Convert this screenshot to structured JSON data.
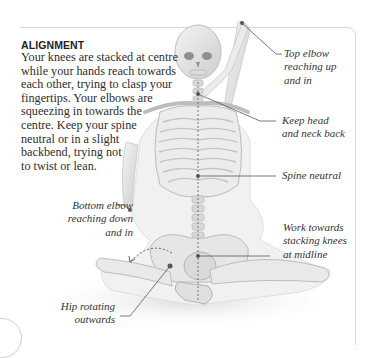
{
  "section": {
    "heading": "ALIGNMENT",
    "body_lines": [
      "Your knees are stacked at centre",
      "while your hands reach towards",
      "each other, trying to clasp your",
      "fingertips. Your elbows are",
      "squeezing in towards the",
      "centre. Keep your spine",
      "neutral or in a slight",
      "backbend, trying not",
      "to twist or lean."
    ]
  },
  "annotations": {
    "top_elbow": [
      "Top elbow",
      "reaching up",
      "and in"
    ],
    "head_neck": [
      "Keep head",
      "and neck back"
    ],
    "spine": [
      "Spine neutral"
    ],
    "knees": [
      "Work towards",
      "stacking knees",
      "at midline"
    ],
    "bottom_elbow": [
      "Bottom elbow",
      "reaching down",
      "and in"
    ],
    "hip": [
      "Hip rotating",
      "outwards"
    ]
  },
  "colors": {
    "frame_border": "#d6d6d6",
    "leader_line": "#555555",
    "bone": "#e9e9e9",
    "bone_shadow": "#bdbdbd"
  },
  "page_number": ""
}
